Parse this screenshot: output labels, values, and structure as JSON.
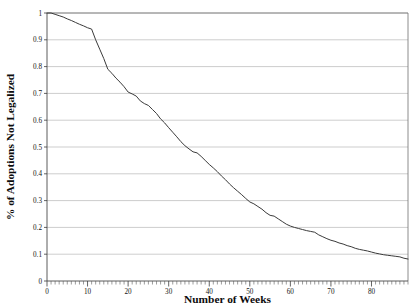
{
  "chart_data": {
    "type": "line",
    "title": "",
    "xlabel": "Number of Weeks",
    "ylabel": "% of Adoptions Not Legalized",
    "xlim": [
      0,
      89
    ],
    "ylim": [
      0,
      1
    ],
    "grid": "horizontal",
    "legend": "none",
    "x_ticks": [
      0,
      10,
      20,
      30,
      40,
      50,
      60,
      70,
      80
    ],
    "x_tick_labels": [
      "0",
      "10",
      "20",
      "30",
      "40",
      "50",
      "60",
      "70",
      "80"
    ],
    "x_minor_tick_interval": 1,
    "y_ticks": [
      0,
      0.1,
      0.2,
      0.3,
      0.4,
      0.5,
      0.6,
      0.7,
      0.8,
      0.9,
      1
    ],
    "y_tick_labels": [
      "0",
      "0.1",
      "0.2",
      "0.3",
      "0.4",
      "0.5",
      "0.6",
      "0.7",
      "0.8",
      "0.9",
      "1"
    ],
    "line_color": "#3a3a3a",
    "grid_color": "#9a9a9a",
    "series": [
      {
        "name": "Adoptions not legalized",
        "x": [
          0,
          1,
          2,
          3,
          4,
          5,
          6,
          7,
          8,
          9,
          10,
          11,
          12,
          13,
          14,
          15,
          16,
          17,
          18,
          19,
          20,
          21,
          22,
          23,
          24,
          25,
          26,
          27,
          28,
          29,
          30,
          31,
          32,
          33,
          34,
          35,
          36,
          37,
          38,
          39,
          40,
          41,
          42,
          43,
          44,
          45,
          46,
          47,
          48,
          49,
          50,
          51,
          52,
          53,
          54,
          55,
          56,
          57,
          58,
          59,
          60,
          61,
          62,
          63,
          64,
          65,
          66,
          67,
          68,
          69,
          70,
          71,
          72,
          73,
          74,
          75,
          76,
          77,
          78,
          79,
          80,
          81,
          82,
          83,
          84,
          85,
          86,
          87,
          88,
          89
        ],
        "y": [
          1.0,
          1.0,
          0.995,
          0.99,
          0.985,
          0.978,
          0.972,
          0.965,
          0.958,
          0.952,
          0.945,
          0.94,
          0.9,
          0.865,
          0.83,
          0.79,
          0.775,
          0.757,
          0.742,
          0.725,
          0.705,
          0.698,
          0.69,
          0.672,
          0.662,
          0.655,
          0.64,
          0.625,
          0.605,
          0.59,
          0.572,
          0.555,
          0.538,
          0.52,
          0.505,
          0.493,
          0.482,
          0.478,
          0.465,
          0.45,
          0.435,
          0.422,
          0.408,
          0.392,
          0.378,
          0.362,
          0.348,
          0.335,
          0.322,
          0.308,
          0.295,
          0.288,
          0.278,
          0.268,
          0.255,
          0.245,
          0.242,
          0.232,
          0.222,
          0.212,
          0.205,
          0.2,
          0.196,
          0.192,
          0.188,
          0.185,
          0.182,
          0.172,
          0.165,
          0.158,
          0.152,
          0.148,
          0.142,
          0.138,
          0.132,
          0.128,
          0.122,
          0.118,
          0.115,
          0.112,
          0.108,
          0.104,
          0.101,
          0.098,
          0.096,
          0.094,
          0.092,
          0.09,
          0.085,
          0.082
        ]
      }
    ]
  },
  "axis": {
    "x_title": "Number of Weeks",
    "y_title": "% of Adoptions Not Legalized"
  },
  "x_tick_labels": {
    "t0": "0",
    "t1": "10",
    "t2": "20",
    "t3": "30",
    "t4": "40",
    "t5": "50",
    "t6": "60",
    "t7": "70",
    "t8": "80"
  },
  "y_tick_labels": {
    "v0": "0",
    "v1": "0.1",
    "v2": "0.2",
    "v3": "0.3",
    "v4": "0.4",
    "v5": "0.5",
    "v6": "0.6",
    "v7": "0.7",
    "v8": "0.8",
    "v9": "0.9",
    "v10": "1"
  }
}
